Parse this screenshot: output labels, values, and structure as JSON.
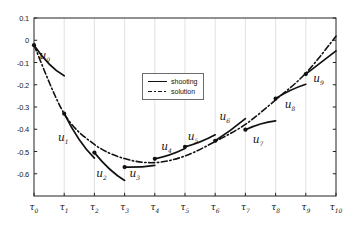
{
  "figure": {
    "background": "#ffffff",
    "axis_color": "#222222",
    "grid_color": "#d9d9d9",
    "line_color": "#111111"
  },
  "chart_data": {
    "type": "line",
    "title": "",
    "xlabel": "",
    "ylabel": "",
    "grid": "vertical-only",
    "x_axis": {
      "tick_base": "τ",
      "tick_subs": [
        "0",
        "1",
        "2",
        "3",
        "4",
        "5",
        "6",
        "7",
        "8",
        "9",
        "10"
      ]
    },
    "y_axis": {
      "tick_labels": [
        "0.1",
        "0",
        "-0.1",
        "-0.2",
        "-0.3",
        "-0.4",
        "-0.5",
        "-0.6"
      ],
      "tick_values": [
        0.1,
        0,
        -0.1,
        -0.2,
        -0.3,
        -0.4,
        -0.5,
        -0.6
      ],
      "min": -0.7,
      "max": 0.1
    },
    "legend": {
      "position": "upper-middle-left",
      "entries": [
        {
          "label": "shooting",
          "style": "solid"
        },
        {
          "label": "solution",
          "style": "dash-dot"
        }
      ]
    },
    "solution_series": {
      "name": "solution",
      "style": "dash-dot",
      "x": [
        0,
        1,
        2,
        3,
        4,
        5,
        6,
        7,
        8,
        9,
        10
      ],
      "values": [
        -0.022,
        -0.33,
        -0.468,
        -0.532,
        -0.55,
        -0.52,
        -0.455,
        -0.378,
        -0.268,
        -0.148,
        0.018
      ]
    },
    "shooting_segments": [
      {
        "label_base": "u",
        "sub": "0",
        "x0": 0,
        "y0": -0.022,
        "x1": 1,
        "y1": -0.16,
        "bend": -0.03,
        "label_t": 0.36,
        "label_v": -0.07
      },
      {
        "label_base": "u",
        "sub": "1",
        "x0": 1,
        "y0": -0.33,
        "x1": 2,
        "y1": -0.53,
        "bend": -0.035,
        "label_t": 0.97,
        "label_v": -0.44
      },
      {
        "label_base": "u",
        "sub": "2",
        "x0": 2,
        "y0": -0.505,
        "x1": 3,
        "y1": -0.63,
        "bend": -0.022,
        "label_t": 2.24,
        "label_v": -0.6
      },
      {
        "label_base": "u",
        "sub": "3",
        "x0": 3,
        "y0": -0.57,
        "x1": 4,
        "y1": -0.562,
        "bend": -0.006,
        "label_t": 3.34,
        "label_v": -0.6
      },
      {
        "label_base": "u",
        "sub": "4",
        "x0": 4,
        "y0": -0.533,
        "x1": 5,
        "y1": -0.487,
        "bend": -0.01,
        "label_t": 4.39,
        "label_v": -0.48
      },
      {
        "label_base": "u",
        "sub": "5",
        "x0": 5,
        "y0": -0.479,
        "x1": 6,
        "y1": -0.425,
        "bend": -0.01,
        "label_t": 5.27,
        "label_v": -0.435
      },
      {
        "label_base": "u",
        "sub": "6",
        "x0": 6,
        "y0": -0.452,
        "x1": 7,
        "y1": -0.352,
        "bend": -0.006,
        "label_t": 6.32,
        "label_v": -0.345
      },
      {
        "label_base": "u",
        "sub": "7",
        "x0": 7,
        "y0": -0.402,
        "x1": 8,
        "y1": -0.362,
        "bend": 0.012,
        "label_t": 7.42,
        "label_v": -0.45
      },
      {
        "label_base": "u",
        "sub": "8",
        "x0": 8,
        "y0": -0.262,
        "x1": 9,
        "y1": -0.198,
        "bend": 0.01,
        "label_t": 8.48,
        "label_v": -0.29
      },
      {
        "label_base": "u",
        "sub": "9",
        "x0": 9,
        "y0": -0.152,
        "x1": 10,
        "y1": -0.048,
        "bend": 0.0,
        "label_t": 9.42,
        "label_v": -0.175
      }
    ]
  }
}
